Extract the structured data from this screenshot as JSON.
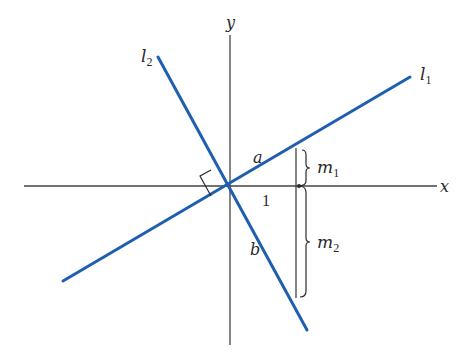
{
  "figure": {
    "type": "perpendicular-lines-slopes",
    "colors": {
      "axes": "#444444",
      "lines": "#1f5fb0",
      "annotations": "#2a2a2a",
      "background": "#ffffff"
    },
    "axes": {
      "x_label": "x",
      "y_label": "y"
    },
    "lines": [
      {
        "id": "l1",
        "label_base": "l",
        "label_sub": "1"
      },
      {
        "id": "l2",
        "label_base": "l",
        "label_sub": "2"
      }
    ],
    "points": {
      "a": "a",
      "b": "b"
    },
    "unit_label": "1",
    "braces": [
      {
        "label_base": "m",
        "label_sub": "1"
      },
      {
        "label_base": "m",
        "label_sub": "2"
      }
    ],
    "right_angle_marker": true
  }
}
